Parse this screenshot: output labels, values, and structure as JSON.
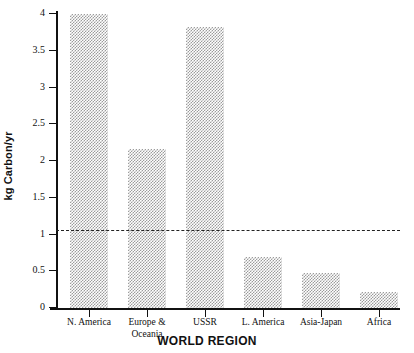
{
  "chart_data": {
    "type": "bar",
    "title": "",
    "xlabel": "WORLD REGION",
    "ylabel": "kg Carbon/yr",
    "categories": [
      "N. America",
      "Europe &\nOceania",
      "USSR",
      "L. America",
      "Asia-Japan",
      "Africa"
    ],
    "values": [
      4.0,
      2.17,
      3.83,
      0.7,
      0.48,
      0.22
    ],
    "ylim": [
      0,
      4
    ],
    "ytick_labels": [
      "0",
      "0.5",
      "1",
      "1.5",
      "2",
      "2.5",
      "3",
      "3.5",
      "4"
    ],
    "ytick_values": [
      0,
      0.5,
      1,
      1.5,
      2,
      2.5,
      3,
      3.5,
      4
    ],
    "grid": false,
    "legend": "none",
    "annotations": [
      {
        "name": "reference-line",
        "type": "horizontal-dashed-line",
        "value": 1.05
      }
    ],
    "bar_fill": "#9c9c9c",
    "axis_color": "#111111"
  }
}
